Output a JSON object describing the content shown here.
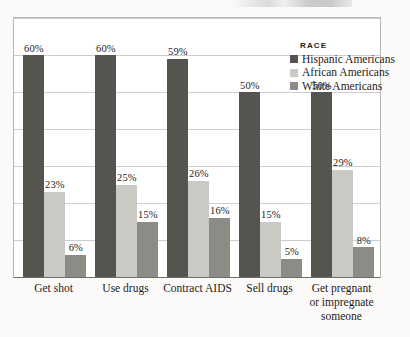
{
  "chart_data": {
    "type": "bar",
    "title": "",
    "xlabel": "",
    "ylabel": "",
    "ylim": [
      0,
      70
    ],
    "grid": true,
    "gridline_step": 10,
    "legend_position": "top-right",
    "legend_title": "RACE",
    "categories": [
      "Get shot",
      "Use drugs",
      "Contract AIDS",
      "Sell drugs",
      "Get pregnant or impregnate someone"
    ],
    "category_lines": [
      [
        "Get shot"
      ],
      [
        "Use drugs"
      ],
      [
        "Contract AIDS"
      ],
      [
        "Sell drugs"
      ],
      [
        "Get pregnant",
        "or impregnate",
        "someone"
      ]
    ],
    "series": [
      {
        "name": "Hispanic Americans",
        "color": "#56544f",
        "values": [
          60,
          60,
          59,
          50,
          50
        ],
        "labels": [
          "60%",
          "60%",
          "59%",
          "50%",
          "50%"
        ]
      },
      {
        "name": "African Americans",
        "color": "#cbc9c4",
        "values": [
          23,
          25,
          26,
          15,
          29
        ],
        "labels": [
          "23%",
          "25%",
          "26%",
          "15%",
          "29%"
        ]
      },
      {
        "name": "White Americans",
        "color": "#8d8b86",
        "values": [
          6,
          15,
          16,
          5,
          8
        ],
        "labels": [
          "6%",
          "15%",
          "16%",
          "5%",
          "8%"
        ]
      }
    ]
  },
  "top_fragment": {
    "note": "cropped illegible headline text"
  }
}
